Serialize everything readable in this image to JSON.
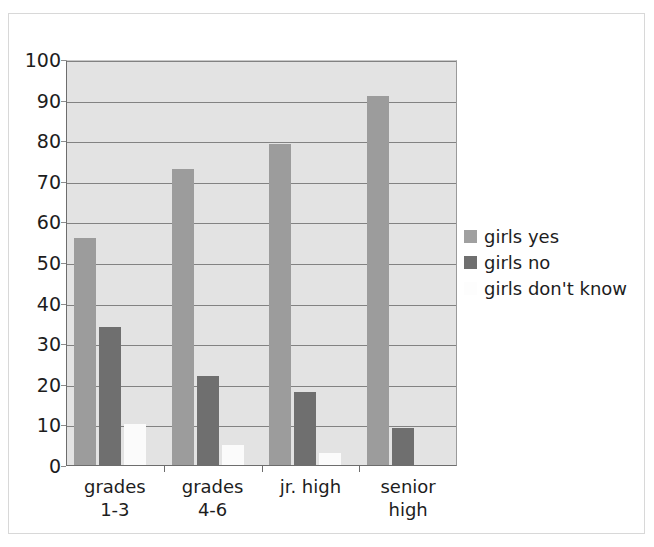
{
  "chart_data": {
    "type": "bar",
    "title": "",
    "subtitle": "",
    "xlabel": "",
    "ylabel": "",
    "categories": [
      "grades 1-3",
      "grades 4-6",
      "jr. high",
      "senior high"
    ],
    "category_lines": [
      [
        "grades",
        "1-3"
      ],
      [
        "grades",
        "4-6"
      ],
      [
        "jr. high",
        ""
      ],
      [
        "senior",
        "high"
      ]
    ],
    "series": [
      {
        "name": "girls yes",
        "color": "#9c9c9c",
        "values": [
          56,
          73,
          79,
          91
        ]
      },
      {
        "name": "girls no",
        "color": "#6f6f6f",
        "values": [
          34,
          22,
          18,
          9
        ]
      },
      {
        "name": "girls don't know",
        "color": "#fbfbfb",
        "values": [
          10,
          5,
          3,
          0
        ]
      }
    ],
    "ylim": [
      0,
      100
    ],
    "ytick_values": [
      0,
      10,
      20,
      30,
      40,
      50,
      60,
      70,
      80,
      90,
      100
    ],
    "ytick_labels": [
      "0",
      "10",
      "20",
      "30",
      "40",
      "50",
      "60",
      "70",
      "80",
      "90",
      "100"
    ],
    "grid": true,
    "grid_axis": "y",
    "legend_position": "right",
    "plot_background": "#e3e3e3",
    "gridline_color": "#828282",
    "axis_color": "#6d6d6d",
    "frame_border_color": "#d8d8d8"
  },
  "legend": {
    "entries": [
      {
        "label": "girls yes",
        "swatch_name": "legend-swatch-girls-yes",
        "swatch_class": "yes"
      },
      {
        "label": "girls no",
        "swatch_name": "legend-swatch-girls-no",
        "swatch_class": "no"
      },
      {
        "label": "girls don't know",
        "swatch_name": "legend-swatch-girls-dont-know",
        "swatch_class": "dk"
      }
    ]
  }
}
